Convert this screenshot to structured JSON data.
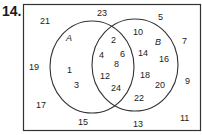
{
  "problem_number": "14.",
  "sets": {
    "A": {
      "label": "A"
    },
    "B": {
      "label": "B"
    }
  },
  "regions": {
    "outside": [
      "21",
      "23",
      "5",
      "19",
      "7",
      "17",
      "15",
      "13",
      "11",
      "9"
    ],
    "only_A": [
      "1",
      "3"
    ],
    "A_and_B": [
      "2",
      "4",
      "6",
      "8",
      "12",
      "24"
    ],
    "only_B": [
      "10",
      "14",
      "16",
      "18",
      "20",
      "22"
    ]
  }
}
